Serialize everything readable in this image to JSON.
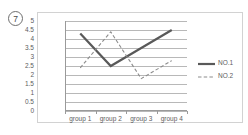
{
  "item_label": "7",
  "chart_data": {
    "type": "line",
    "title": "",
    "xlabel": "",
    "ylabel": "",
    "categories": [
      "group 1",
      "group 2",
      "group 3",
      "group 4"
    ],
    "ylim": [
      0,
      5
    ],
    "ytick_step": 0.5,
    "yticks": [
      "5",
      "4.5",
      "4",
      "3.5",
      "3",
      "2.5",
      "2",
      "1.5",
      "1",
      "0.5",
      "0"
    ],
    "grid": true,
    "legend_position": "right",
    "series": [
      {
        "name": "NO.1",
        "values": [
          4.3,
          2.5,
          3.5,
          4.5
        ],
        "style": "solid",
        "color": "#595959",
        "width": 2.2
      },
      {
        "name": "NO.2",
        "values": [
          2.4,
          4.4,
          1.8,
          2.8
        ],
        "style": "dashed",
        "color": "#8c8c8c",
        "width": 1.1
      }
    ]
  },
  "colors": {
    "frame": "#d2d2d2",
    "gridline": "#b8b8b8",
    "axis": "#9a9a9a",
    "text": "#5d5d5d"
  }
}
